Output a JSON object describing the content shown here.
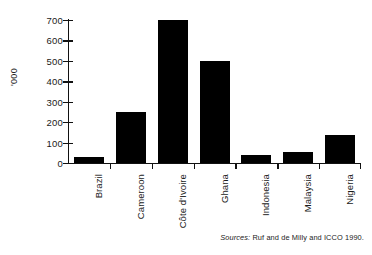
{
  "chart_data": {
    "type": "bar",
    "title": "",
    "subtitle": "",
    "xlabel": "",
    "ylabel": "'000",
    "categories": [
      "Brazil",
      "Cameroon",
      "Côte d'Ivoire",
      "Ghana",
      "Indonesia",
      "Malaysia",
      "Nigeria"
    ],
    "values": [
      30,
      250,
      700,
      500,
      40,
      55,
      135
    ],
    "ylim": [
      0,
      700
    ],
    "yticks": [
      0,
      100,
      200,
      300,
      400,
      500,
      600,
      700
    ],
    "ytick_labels": [
      "0",
      "100",
      "200",
      "300",
      "400",
      "500",
      "600",
      "700"
    ],
    "grid": false,
    "legend": null,
    "bar_color": "#000000",
    "axis_color": "#111111",
    "annotations": [
      "Sources: Ruf and de Milly and ICCO 1990."
    ]
  },
  "source": {
    "prefix": "Sources:",
    "text": " Ruf and de Milly and ICCO 1990."
  }
}
